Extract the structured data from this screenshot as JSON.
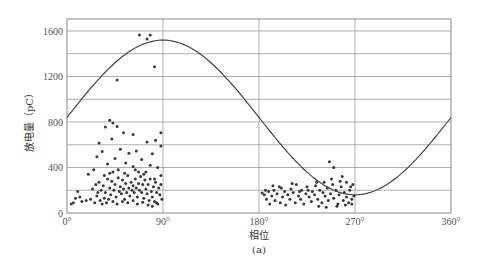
{
  "chart_data": {
    "type": "scatter",
    "title": "",
    "caption": "(a)",
    "xlabel": "相位",
    "ylabel": "放电量（pC）",
    "xlim": [
      0,
      360
    ],
    "ylim": [
      0,
      1700
    ],
    "x_ticks": [
      0,
      90,
      180,
      270,
      360
    ],
    "x_tick_labels": [
      "0°",
      "90°",
      "180°",
      "270°",
      "360°"
    ],
    "y_ticks": [
      0,
      400,
      800,
      1200,
      1600
    ],
    "y_tick_labels": [
      "0",
      "400",
      "800",
      "1200",
      "1600"
    ],
    "y_gridlines": [
      0,
      200,
      400,
      600,
      800,
      1000,
      1200,
      1400,
      1600
    ],
    "grid": true,
    "legend": null,
    "series": [
      {
        "name": "reference sine",
        "type": "line",
        "formula": "840 + 680*sin(phase)",
        "offset": 840,
        "amplitude": 680,
        "peak": {
          "x": 90,
          "y": 1520
        },
        "trough": {
          "x": 270,
          "y": 160
        }
      },
      {
        "name": "discharge pulses",
        "type": "scatter",
        "points": [
          [
            68,
            1565
          ],
          [
            78,
            1565
          ],
          [
            75,
            1530
          ],
          [
            82,
            1285
          ],
          [
            47,
            1170
          ],
          [
            40,
            815
          ],
          [
            43,
            790
          ],
          [
            36,
            755
          ],
          [
            47,
            760
          ],
          [
            53,
            705
          ],
          [
            62,
            690
          ],
          [
            88,
            705
          ],
          [
            83,
            640
          ],
          [
            75,
            625
          ],
          [
            30,
            615
          ],
          [
            42,
            650
          ],
          [
            50,
            560
          ],
          [
            33,
            540
          ],
          [
            28,
            495
          ],
          [
            58,
            525
          ],
          [
            65,
            545
          ],
          [
            80,
            520
          ],
          [
            88,
            590
          ],
          [
            70,
            470
          ],
          [
            45,
            480
          ],
          [
            38,
            430
          ],
          [
            55,
            440
          ],
          [
            62,
            410
          ],
          [
            78,
            420
          ],
          [
            85,
            400
          ],
          [
            25,
            380
          ],
          [
            48,
            380
          ],
          [
            20,
            340
          ],
          [
            40,
            350
          ],
          [
            67,
            360
          ],
          [
            72,
            340
          ],
          [
            88,
            330
          ],
          [
            10,
            190
          ],
          [
            8,
            130
          ],
          [
            12,
            140
          ],
          [
            18,
            110
          ],
          [
            6,
            90
          ],
          [
            4,
            80
          ],
          [
            14,
            100
          ],
          [
            22,
            120
          ],
          [
            26,
            90
          ],
          [
            30,
            270
          ],
          [
            32,
            200
          ],
          [
            34,
            240
          ],
          [
            36,
            180
          ],
          [
            38,
            300
          ],
          [
            40,
            220
          ],
          [
            41,
            160
          ],
          [
            42,
            280
          ],
          [
            44,
            200
          ],
          [
            45,
            250
          ],
          [
            46,
            140
          ],
          [
            48,
            310
          ],
          [
            49,
            190
          ],
          [
            50,
            230
          ],
          [
            51,
            170
          ],
          [
            52,
            290
          ],
          [
            53,
            210
          ],
          [
            54,
            120
          ],
          [
            55,
            260
          ],
          [
            56,
            180
          ],
          [
            57,
            330
          ],
          [
            58,
            220
          ],
          [
            59,
            150
          ],
          [
            60,
            270
          ],
          [
            61,
            200
          ],
          [
            62,
            240
          ],
          [
            63,
            180
          ],
          [
            64,
            300
          ],
          [
            65,
            220
          ],
          [
            66,
            140
          ],
          [
            67,
            260
          ],
          [
            68,
            200
          ],
          [
            69,
            320
          ],
          [
            70,
            180
          ],
          [
            71,
            250
          ],
          [
            72,
            130
          ],
          [
            73,
            290
          ],
          [
            74,
            210
          ],
          [
            75,
            170
          ],
          [
            76,
            250
          ],
          [
            77,
            110
          ],
          [
            78,
            300
          ],
          [
            79,
            190
          ],
          [
            80,
            140
          ],
          [
            81,
            230
          ],
          [
            82,
            100
          ],
          [
            83,
            270
          ],
          [
            84,
            180
          ],
          [
            85,
            80
          ],
          [
            86,
            220
          ],
          [
            87,
            160
          ],
          [
            88,
            250
          ],
          [
            89,
            120
          ],
          [
            28,
            150
          ],
          [
            31,
            110
          ],
          [
            33,
            80
          ],
          [
            35,
            130
          ],
          [
            37,
            90
          ],
          [
            39,
            120
          ],
          [
            43,
            100
          ],
          [
            47,
            80
          ],
          [
            52,
            100
          ],
          [
            57,
            90
          ],
          [
            62,
            110
          ],
          [
            66,
            80
          ],
          [
            71,
            95
          ],
          [
            76,
            70
          ],
          [
            80,
            60
          ],
          [
            84,
            90
          ],
          [
            24,
            210
          ],
          [
            27,
            250
          ],
          [
            29,
            180
          ],
          [
            35,
            330
          ],
          [
            43,
            360
          ],
          [
            54,
            350
          ],
          [
            64,
            380
          ],
          [
            74,
            360
          ],
          [
            82,
            300
          ],
          [
            183,
            175
          ],
          [
            185,
            160
          ],
          [
            187,
            120
          ],
          [
            189,
            190
          ],
          [
            190,
            80
          ],
          [
            192,
            150
          ],
          [
            194,
            200
          ],
          [
            195,
            110
          ],
          [
            197,
            170
          ],
          [
            199,
            230
          ],
          [
            200,
            90
          ],
          [
            202,
            140
          ],
          [
            204,
            190
          ],
          [
            205,
            70
          ],
          [
            207,
            160
          ],
          [
            209,
            120
          ],
          [
            210,
            210
          ],
          [
            212,
            180
          ],
          [
            214,
            90
          ],
          [
            215,
            250
          ],
          [
            217,
            150
          ],
          [
            219,
            120
          ],
          [
            220,
            200
          ],
          [
            222,
            80
          ],
          [
            224,
            170
          ],
          [
            225,
            230
          ],
          [
            227,
            140
          ],
          [
            229,
            100
          ],
          [
            230,
            190
          ],
          [
            232,
            160
          ],
          [
            234,
            270
          ],
          [
            235,
            120
          ],
          [
            237,
            200
          ],
          [
            239,
            90
          ],
          [
            240,
            180
          ],
          [
            242,
            150
          ],
          [
            244,
            220
          ],
          [
            245,
            110
          ],
          [
            247,
            170
          ],
          [
            249,
            250
          ],
          [
            250,
            130
          ],
          [
            252,
            200
          ],
          [
            254,
            80
          ],
          [
            255,
            160
          ],
          [
            257,
            230
          ],
          [
            259,
            110
          ],
          [
            260,
            180
          ],
          [
            262,
            140
          ],
          [
            264,
            90
          ],
          [
            265,
            200
          ],
          [
            267,
            120
          ],
          [
            268,
            250
          ],
          [
            186,
            200
          ],
          [
            193,
            240
          ],
          [
            201,
            220
          ],
          [
            211,
            260
          ],
          [
            218,
            190
          ],
          [
            226,
            200
          ],
          [
            233,
            240
          ],
          [
            241,
            270
          ],
          [
            246,
            450
          ],
          [
            250,
            400
          ],
          [
            256,
            280
          ],
          [
            262,
            270
          ],
          [
            248,
            300
          ],
          [
            258,
            320
          ],
          [
            266,
            230
          ],
          [
            269,
            150
          ],
          [
            236,
            60
          ],
          [
            243,
            50
          ],
          [
            253,
            60
          ],
          [
            261,
            70
          ],
          [
            267,
            80
          ]
        ]
      }
    ]
  }
}
